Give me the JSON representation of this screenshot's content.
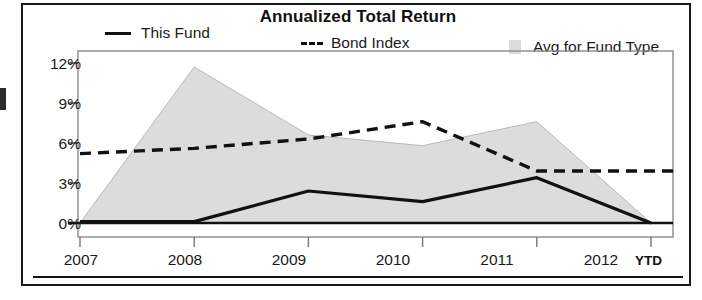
{
  "chart_data": {
    "type": "area",
    "title": "Annualized Total Return",
    "xlabel": "",
    "ylabel": "",
    "x": [
      "2007",
      "2008",
      "2009",
      "2010",
      "2011",
      "2012"
    ],
    "categories": [
      "2007",
      "2008",
      "2009",
      "2010",
      "2011",
      "2012"
    ],
    "xtick_labels": [
      "2007",
      "2008",
      "2009",
      "2010",
      "2011",
      "2012"
    ],
    "xtick_suffix": "YTD",
    "ytick_labels": [
      "0%",
      "3%",
      "6%",
      "9%",
      "12%"
    ],
    "ytick_values": [
      0,
      3,
      6,
      9,
      12
    ],
    "ylim": [
      0,
      12
    ],
    "grid": false,
    "legend_position": "top",
    "series": [
      {
        "name": "This Fund",
        "style": "solid-line",
        "color": "#111111",
        "values": [
          0.1,
          0.1,
          2.4,
          1.6,
          3.4,
          0.0
        ]
      },
      {
        "name": "Bond Index",
        "style": "dashed-line",
        "color": "#111111",
        "values": [
          5.2,
          5.6,
          6.3,
          7.6,
          3.9,
          3.9
        ]
      },
      {
        "name": "Avg for Fund Type",
        "style": "filled-area",
        "color": "#dcdcdc",
        "values": [
          0.0,
          11.7,
          6.6,
          5.8,
          7.6,
          0.0
        ]
      }
    ]
  },
  "legend": {
    "items": [
      {
        "label": "This Fund",
        "marker": "solid-line-swatch"
      },
      {
        "label": "Bond Index",
        "marker": "dashed-line-swatch"
      },
      {
        "label": "Avg for Fund Type",
        "marker": "area-swatch"
      }
    ]
  },
  "axes": {
    "y_ticks": [
      "12%",
      "9%",
      "6%",
      "3%",
      "0%"
    ],
    "x_ticks": [
      "2007",
      "2008",
      "2009",
      "2010",
      "2011",
      "2012"
    ],
    "x_suffix": "YTD"
  }
}
